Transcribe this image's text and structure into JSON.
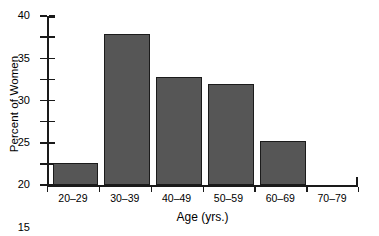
{
  "chart_data": {
    "type": "bar",
    "title": "",
    "subtitle": "",
    "xlabel": "Age (yrs.)",
    "ylabel": "Percent of Women",
    "categories": [
      "20–29",
      "30–39",
      "40–49",
      "50–59",
      "60–69",
      "70–79"
    ],
    "values": [
      5.2,
      35.7,
      25.6,
      24.0,
      10.5,
      0
    ],
    "ylim": [
      0,
      40
    ],
    "xlim_note": "categorical, six equal-width class intervals",
    "ytick_labels": [
      "0",
      "5",
      "10",
      "15",
      "20",
      "25",
      "30",
      "35",
      "40"
    ],
    "ytick_values": [
      0,
      5,
      10,
      15,
      20,
      25,
      30,
      35,
      40
    ],
    "grid": false,
    "legend": null,
    "legend_position": "none",
    "bar_color": "#565656",
    "bar_edge_color": "#1b1b1b",
    "axis_color": "#1a1a1a",
    "background_color": "#ffffff",
    "annotations": []
  }
}
